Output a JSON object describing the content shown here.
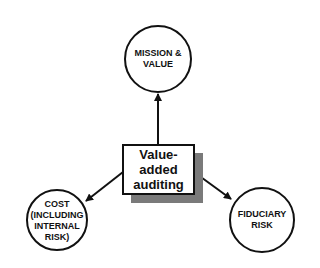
{
  "diagram": {
    "center": {
      "label_lines": [
        "Value-",
        "added",
        "auditing"
      ]
    },
    "nodes": [
      {
        "id": "mission",
        "label_lines": [
          "MISSION &",
          "VALUE"
        ]
      },
      {
        "id": "cost",
        "label_lines": [
          "COST",
          "(INCLUDING",
          "INTERNAL",
          "RISK)"
        ]
      },
      {
        "id": "fiduciary",
        "label_lines": [
          "FIDUCIARY",
          "RISK"
        ]
      }
    ],
    "edges": [
      {
        "from": "center",
        "to": "mission"
      },
      {
        "from": "center",
        "to": "cost"
      },
      {
        "from": "center",
        "to": "fiduciary"
      }
    ],
    "colors": {
      "stroke": "#111111",
      "shadow": "#7a7a7a",
      "background": "#ffffff"
    }
  }
}
